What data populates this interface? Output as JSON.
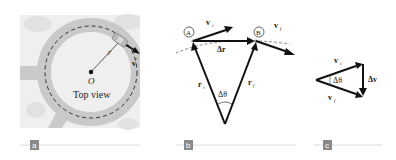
{
  "panels": [
    {
      "id": "a",
      "badge": "a",
      "labels": {
        "center": "O",
        "radius": "r",
        "velocity": "v",
        "caption": "Top view"
      }
    },
    {
      "id": "b",
      "badge": "b",
      "labels": {
        "point_a": "A",
        "point_b": "B",
        "v_initial": "v",
        "v_initial_sub": "i",
        "v_final": "v",
        "v_final_sub": "f",
        "delta_r": "Δr",
        "r_initial": "r",
        "r_initial_sub": "i",
        "r_final": "r",
        "r_final_sub": "f",
        "delta_theta": "Δθ"
      }
    },
    {
      "id": "c",
      "badge": "c",
      "labels": {
        "v_initial": "v",
        "v_initial_sub": "i",
        "v_final": "v",
        "v_final_sub": "f",
        "delta_v": "Δv",
        "delta_theta": "Δθ"
      }
    }
  ],
  "colors": {
    "road": "#c9c9c9",
    "background_tile": "#efefef",
    "shrub": "#e2e2e2",
    "vector": "#111111",
    "badge": "#8a8a8a",
    "rule": "#cfcfcf",
    "car": "#b8b8b8"
  }
}
